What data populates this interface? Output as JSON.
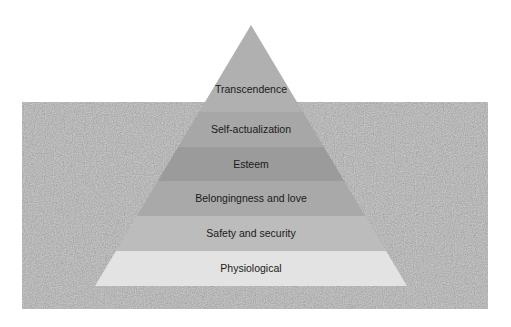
{
  "diagram": {
    "type": "pyramid",
    "background": {
      "color": "#9a9a9a",
      "texture": "speckled-noise"
    },
    "levels_top_to_bottom": [
      {
        "label": "Transcendence",
        "color": "#b0b0b0"
      },
      {
        "label": "Self-actualization",
        "color": "#a7a7a7"
      },
      {
        "label": "Esteem",
        "color": "#9b9b9b"
      },
      {
        "label": "Belongingness and love",
        "color": "#a9a9a9"
      },
      {
        "label": "Safety and security",
        "color": "#bcbcbc"
      },
      {
        "label": "Physiological",
        "color": "#e3e3e3"
      }
    ]
  }
}
